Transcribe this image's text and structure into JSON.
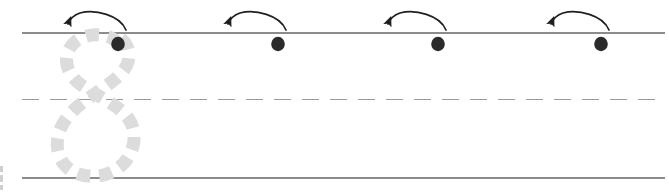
{
  "worksheet": {
    "title": "Number 8 Handwriting Tracing Practice Row",
    "page_width": 669,
    "page_height": 194,
    "background_color": "#ffffff",
    "character": "8",
    "instruction_implied": "Trace the dashed 8, then write it starting at each dot following the arrow"
  },
  "colors": {
    "guide_line": "#8c8c8c",
    "midline_dashed": "#9a9a9a",
    "trace_guide": "#dcdcdc",
    "start_dot": "#2b2b2b",
    "arrow": "#1f1f1f",
    "edge_artifact": "#cfcfcf"
  },
  "guide_lines": [
    {
      "name": "top-line",
      "label": "Top line",
      "style": "solid",
      "y": 33,
      "x_start": 22,
      "x_end": 665,
      "thickness": 1.6
    },
    {
      "name": "mid-line",
      "label": "Dashed midline",
      "style": "dashed",
      "y": 99.5,
      "x_start": 22,
      "x_end": 665,
      "thickness": 1.8,
      "dash_pattern": "17 11"
    },
    {
      "name": "base-line",
      "label": "Baseline",
      "style": "solid",
      "y": 178,
      "x_start": 22,
      "x_end": 665,
      "thickness": 1.6
    }
  ],
  "trace_guide": {
    "name": "dashed-eight-trace",
    "character": "8",
    "color": "#dcdcdc",
    "stroke_width": 13,
    "dash_pattern": "13 9",
    "x_left": 58,
    "x_right": 137,
    "y_top": 34,
    "y_bottom": 178,
    "loop_top_center_y": 68,
    "loop_bottom_center_y": 142,
    "crossing_y": 103
  },
  "practice_slots": [
    {
      "index": 1,
      "name": "slot-1",
      "label": "Traced example 8",
      "has_trace_guide": true,
      "dot": {
        "cx": 118,
        "cy": 44,
        "rx": 6.8,
        "ry": 7.2
      },
      "arrow": {
        "start_x": 126,
        "start_y": 29,
        "end_x": 68,
        "end_y": 25,
        "peak_y": 13,
        "direction": "right-to-left-arc"
      }
    },
    {
      "index": 2,
      "name": "slot-2",
      "label": "Blank practice 8",
      "has_trace_guide": false,
      "dot": {
        "cx": 278,
        "cy": 44,
        "rx": 6.8,
        "ry": 7.2
      },
      "arrow": {
        "start_x": 286,
        "start_y": 29,
        "end_x": 228,
        "end_y": 25,
        "peak_y": 13,
        "direction": "right-to-left-arc"
      }
    },
    {
      "index": 3,
      "name": "slot-3",
      "label": "Blank practice 8",
      "has_trace_guide": false,
      "dot": {
        "cx": 438,
        "cy": 44,
        "rx": 6.8,
        "ry": 7.2
      },
      "arrow": {
        "start_x": 446,
        "start_y": 29,
        "end_x": 388,
        "end_y": 25,
        "peak_y": 13,
        "direction": "right-to-left-arc"
      }
    },
    {
      "index": 4,
      "name": "slot-4",
      "label": "Blank practice 8",
      "has_trace_guide": false,
      "dot": {
        "cx": 601,
        "cy": 44,
        "rx": 6.8,
        "ry": 7.2
      },
      "arrow": {
        "start_x": 609,
        "start_y": 29,
        "end_x": 551,
        "end_y": 25,
        "peak_y": 13,
        "direction": "right-to-left-arc"
      }
    }
  ],
  "edge_artifacts": [
    {
      "name": "left-edge-speck-1",
      "x": 0,
      "y": 166,
      "width": 3,
      "height": 6
    },
    {
      "name": "left-edge-speck-2",
      "x": 0,
      "y": 175,
      "width": 3,
      "height": 7
    },
    {
      "name": "left-edge-speck-3",
      "x": 0,
      "y": 185,
      "width": 3,
      "height": 5
    }
  ]
}
